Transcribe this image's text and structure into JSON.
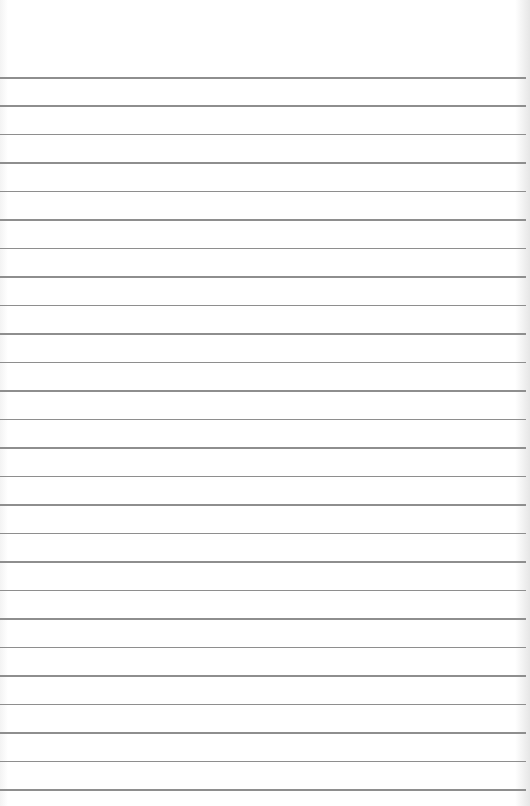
{
  "paper": {
    "type": "lined-notebook-page",
    "line_count": 26,
    "first_line_y": 77,
    "line_spacing": 28.48,
    "line_color": "#8e8e8e",
    "background_color": "#ffffff"
  }
}
